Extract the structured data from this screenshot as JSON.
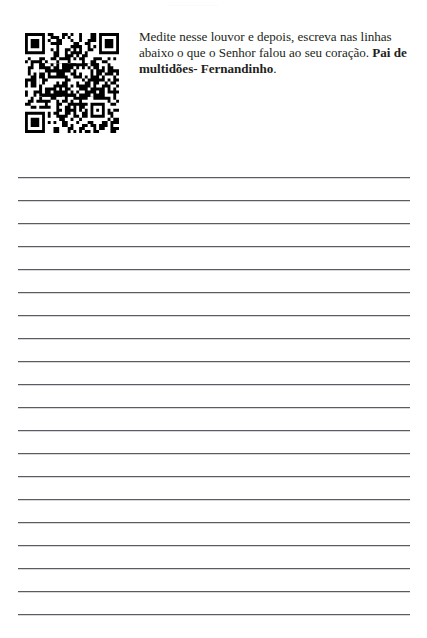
{
  "page": {
    "background_color": "#ffffff",
    "text_color": "#231f20",
    "rule_color": "#5c5c60",
    "header_smudge": "........................"
  },
  "qr_code": {
    "icon_name": "qr-code",
    "alt": "QR code linking to worship song",
    "module_color": "#000000",
    "background_color": "#ffffff"
  },
  "instruction": {
    "line1": "Medite nesse louvor e depois, escreva nas linhas",
    "line2_regular": "abaixo o que o Senhor falou ao seu coração. ",
    "line2_bold": "Pai",
    "line3_bold": "de multidões- Fernandinho",
    "line3_end": ".",
    "full_text": "Medite nesse louvor e depois, escreva nas linhas abaixo o que o Senhor falou ao seu coração. Pai de multidões- Fernandinho."
  },
  "writing_area": {
    "line_count": 20,
    "first_line_y": 177,
    "line_spacing": 23,
    "line_left": 18,
    "line_width": 392
  }
}
